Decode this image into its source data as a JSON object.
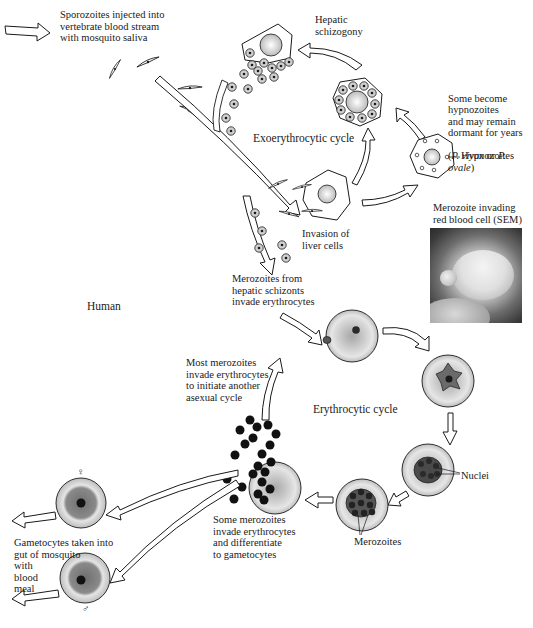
{
  "labels": {
    "sporozoites_injected": "Sporozoites injected into\nvertebrate blood stream\nwith mosquito saliva",
    "hepatic_schizogony": "Hepatic\nschizogony",
    "exoerythrocytic_cycle": "Exoerythrocytic cycle",
    "hypnozoites_note_line1": "Some become\nhypnozoites\nand may remain\ndormant for years",
    "hypnozoites_species_open": "(",
    "hypnozoites_species_a": "P. vivax",
    "hypnozoites_species_or": " or ",
    "hypnozoites_species_b": "P. ovale",
    "hypnozoites_species_close": ")",
    "hypnozoites_pointer": "Hypnozoites",
    "invasion_liver": "Invasion of\nliver cells",
    "sem_caption": "Merozoite invading\nred blood cell (SEM)",
    "merozoites_from_hepatic": "Merozoites from\nhepatic schizonts\ninvade erythrocytes",
    "human": "Human",
    "most_merozoites": "Most merozoites\ninvade erythrocytes\nto initiate another\nasexual cycle",
    "erythrocytic_cycle": "Erythrocytic cycle",
    "nuclei": "Nuclei",
    "merozoites": "Merozoites",
    "some_merozoites": "Some merozoites\ninvade erythrocytes\nand differentiate\nto gametocytes",
    "gametocytes_taken": "Gametocytes taken into\ngut of mosquito\nwith\nblood\nmeal",
    "female_symbol": "♀",
    "male_symbol": "♂"
  },
  "colors": {
    "ink": "#1a1a1a",
    "cell_fill": "#ffffff",
    "rbc_rim": "#d9d9d9",
    "rbc_center": "#9a9a9a",
    "parasite": "#5a5a5a",
    "merozoite_dot": "#111111"
  }
}
